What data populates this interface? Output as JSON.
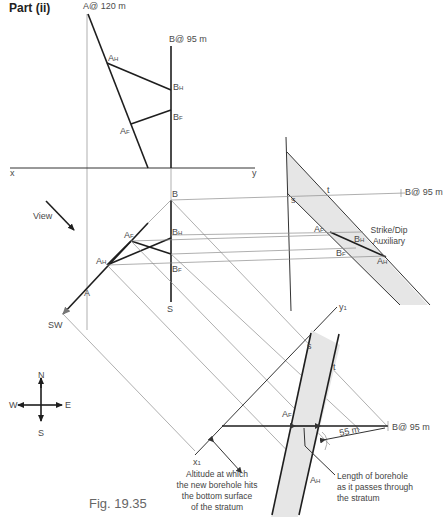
{
  "figure": {
    "part_title": "Part (ii)",
    "caption": "Fig. 19.35"
  },
  "elevation": {
    "point_a": "A@ 120 m",
    "point_b": "B@ 95 m",
    "a_h": "A",
    "a_h_sub": "H",
    "b_h": "B",
    "b_h_sub": "H",
    "a_f": "A",
    "a_f_sub": "F",
    "b_f": "B",
    "b_f_sub": "F",
    "x_label": "x",
    "y_label": "y"
  },
  "plan": {
    "b": "B",
    "b_h": "B",
    "b_h_sub": "H",
    "b_f": "B",
    "b_f_sub": "F",
    "a_f": "A",
    "a_f_sub": "F",
    "a_h": "A",
    "a_h_sub": "H",
    "a": "A",
    "s": "S",
    "sw": "SW",
    "view": "View"
  },
  "auxiliary": {
    "s": "s",
    "t": "t",
    "b_label": "B@ 95 m",
    "a_f": "A",
    "a_f_sub": "F",
    "b_h": "B",
    "b_h_sub": "H",
    "b_f": "B",
    "b_f_sub": "F",
    "a_h": "A",
    "a_h_sub": "H",
    "title_line1": "Strike/Dip",
    "title_line2": "Auxiliary"
  },
  "secondary": {
    "y1": "y",
    "y1_sub": "1",
    "x1": "x",
    "x1_sub": "1",
    "s": "s",
    "t": "t",
    "a_f": "A",
    "a_f_sub": "F",
    "a_h": "A",
    "a_h_sub": "H",
    "b_label": "B@ 95 m",
    "dimension": "55 m"
  },
  "compass": {
    "n": "N",
    "s": "S",
    "e": "E",
    "w": "W"
  },
  "annotations": {
    "altitude": [
      "Altitude at which",
      "the new borehole hits",
      "the bottom surface",
      "of the stratum"
    ],
    "length": [
      "Length of borehole",
      "as it passes through",
      "the stratum"
    ]
  },
  "colors": {
    "line_thick": "#1e1e1e",
    "line_thin": "#8c8c8c",
    "band_fill": "#e6e6e6",
    "text": "#4a4a4a"
  }
}
